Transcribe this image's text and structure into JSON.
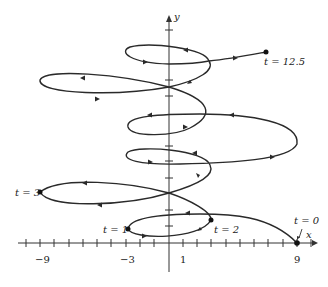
{
  "figure": {
    "title": "",
    "axes": {
      "x_label": "x",
      "y_label": "y",
      "x_tick_labels": [
        "−9",
        "−3",
        "1",
        "9"
      ],
      "x_range": [
        -10,
        10
      ]
    },
    "curve": {
      "type": "parametric",
      "color": "#2a2a2a",
      "direction_arrows": true,
      "t_range": [
        0,
        12.5
      ]
    },
    "points": [
      {
        "label": "t = 0",
        "x": 9,
        "y": 0
      },
      {
        "label": "t = 1",
        "x": -3
      },
      {
        "label": "t = 2",
        "x": 3
      },
      {
        "label": "t = 3",
        "x": -9
      },
      {
        "label": "t = 12.5",
        "x": 7
      }
    ]
  }
}
